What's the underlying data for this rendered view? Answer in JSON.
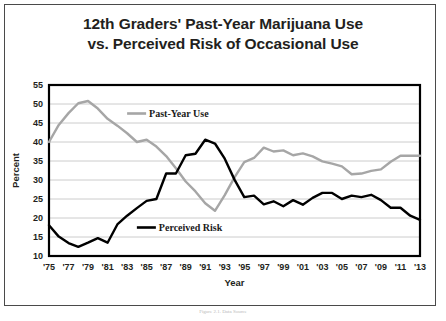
{
  "figure": {
    "title_line1": "12th Graders' Past-Year Marijuana Use",
    "title_line2": "vs. Perceived Risk of Occasional Use",
    "caption": "Figure 2.1. Data Source"
  },
  "colors": {
    "past_year_use": "#a6a6a6",
    "perceived_risk": "#000000",
    "grid": "#bfbfbf",
    "frame": "#4a4a4a",
    "plot_border": "#000000",
    "text": "#231f20",
    "background": "#ffffff"
  },
  "chart_data": {
    "type": "line",
    "title": "12th Graders' Past-Year Marijuana Use vs. Perceived Risk of Occasional Use",
    "xlabel": "Year",
    "ylabel": "Percent",
    "ylim": [
      10,
      55
    ],
    "ytick_step": 5,
    "yticks": [
      10,
      15,
      20,
      25,
      30,
      35,
      40,
      45,
      50,
      55
    ],
    "ytick_labels": [
      "10",
      "15",
      "20",
      "25",
      "30",
      "35",
      "40",
      "45",
      "50",
      "55"
    ],
    "xlim": [
      1975,
      2013
    ],
    "xtick_step": 2,
    "x": [
      1975,
      1976,
      1977,
      1978,
      1979,
      1980,
      1981,
      1982,
      1983,
      1984,
      1985,
      1986,
      1987,
      1988,
      1989,
      1990,
      1991,
      1992,
      1993,
      1994,
      1995,
      1996,
      1997,
      1998,
      1999,
      2000,
      2001,
      2002,
      2003,
      2004,
      2005,
      2006,
      2007,
      2008,
      2009,
      2010,
      2011,
      2012,
      2013
    ],
    "xtick_labels": [
      "'75",
      "'77",
      "'79",
      "'81",
      "'83",
      "'85",
      "'87",
      "'89",
      "'91",
      "'93",
      "'95",
      "'97",
      "'99",
      "'01",
      "'03",
      "'05",
      "'07",
      "'09",
      "'11",
      "'13"
    ],
    "grid": "horizontal",
    "legend_position": "inline-labels",
    "series": [
      {
        "name": "Past-Year Use",
        "color": "#a6a6a6",
        "label_x": 1983,
        "label_y": 47.5,
        "values": [
          40.0,
          44.5,
          47.6,
          50.2,
          50.8,
          48.8,
          46.1,
          44.3,
          42.3,
          40.0,
          40.6,
          38.8,
          36.3,
          33.1,
          29.6,
          27.0,
          23.9,
          21.9,
          26.0,
          30.7,
          34.7,
          35.8,
          38.5,
          37.5,
          37.8,
          36.5,
          37.0,
          36.2,
          34.9,
          34.3,
          33.6,
          31.5,
          31.7,
          32.4,
          32.8,
          34.8,
          36.4,
          36.4,
          36.4
        ]
      },
      {
        "name": "Perceived Risk",
        "color": "#000000",
        "label_x": 1984,
        "label_y": 17.5,
        "values": [
          18.1,
          15.1,
          13.4,
          12.4,
          13.5,
          14.7,
          13.5,
          18.3,
          20.6,
          22.6,
          24.5,
          25.0,
          31.7,
          31.7,
          36.5,
          36.9,
          40.6,
          39.6,
          35.6,
          30.1,
          25.5,
          25.9,
          23.6,
          24.4,
          23.1,
          24.7,
          23.5,
          25.3,
          26.6,
          26.6,
          25.0,
          25.9,
          25.5,
          26.1,
          24.7,
          22.7,
          22.7,
          20.6,
          19.5
        ]
      }
    ]
  }
}
